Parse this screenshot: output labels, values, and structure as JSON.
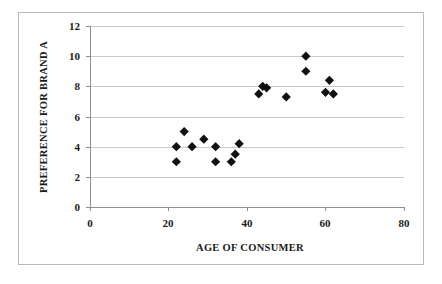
{
  "chart_data": {
    "type": "scatter",
    "title": "",
    "xlabel": "AGE OF CONSUMER",
    "ylabel": "PREFERENCE FOR BRAND A",
    "xlim": [
      0,
      80
    ],
    "ylim": [
      0,
      12
    ],
    "xticks": [
      0,
      20,
      40,
      60,
      80
    ],
    "yticks": [
      0,
      2,
      4,
      6,
      8,
      10,
      12
    ],
    "xtick_labels": [
      "0",
      "20",
      "40",
      "60",
      "80"
    ],
    "ytick_labels": [
      "0",
      "2",
      "4",
      "6",
      "8",
      "10",
      "12"
    ],
    "grid": "horizontal",
    "legend": "none",
    "marker": "filled-diamond",
    "marker_color": "#111111",
    "series": [
      {
        "name": "Consumers",
        "points": [
          {
            "x": 22,
            "y": 4.0
          },
          {
            "x": 22,
            "y": 3.0
          },
          {
            "x": 24,
            "y": 5.0
          },
          {
            "x": 26,
            "y": 4.0
          },
          {
            "x": 29,
            "y": 4.5
          },
          {
            "x": 32,
            "y": 4.0
          },
          {
            "x": 32,
            "y": 3.0
          },
          {
            "x": 36,
            "y": 3.0
          },
          {
            "x": 37,
            "y": 3.5
          },
          {
            "x": 38,
            "y": 4.2
          },
          {
            "x": 43,
            "y": 7.5
          },
          {
            "x": 44,
            "y": 8.0
          },
          {
            "x": 45,
            "y": 7.9
          },
          {
            "x": 50,
            "y": 7.3
          },
          {
            "x": 55,
            "y": 10.0
          },
          {
            "x": 55,
            "y": 9.0
          },
          {
            "x": 61,
            "y": 8.4
          },
          {
            "x": 60,
            "y": 7.6
          },
          {
            "x": 62,
            "y": 7.5
          }
        ]
      }
    ]
  },
  "axes": {
    "x_title": "AGE OF CONSUMER",
    "y_title": "PREFERENCE FOR BRAND A"
  }
}
